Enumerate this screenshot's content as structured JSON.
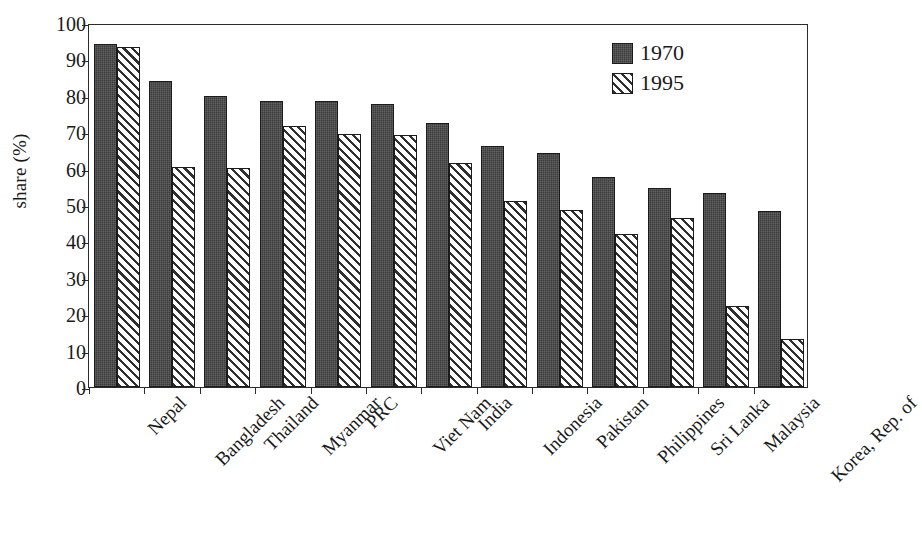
{
  "chart": {
    "type": "bar",
    "ylabel": "share (%)",
    "xlabel": "",
    "title": "",
    "legend_position": "top-right"
  },
  "axis": {
    "y_ticks": [
      "100",
      "90",
      "80",
      "70",
      "60",
      "50",
      "40",
      "30",
      "20",
      "10",
      "0"
    ],
    "y_min": 0,
    "y_max": 100,
    "y_step": 10
  },
  "legend": {
    "entries": [
      {
        "label": "1970",
        "swatch": "solid-dark",
        "color": "#3b3b3b"
      },
      {
        "label": "1995",
        "swatch": "diagonal-hatch",
        "color": "#2f2f2f"
      }
    ]
  },
  "chart_data": {
    "type": "bar",
    "title": "",
    "xlabel": "",
    "ylabel": "share (%)",
    "ylim": [
      0,
      100
    ],
    "ytick_step": 10,
    "grid": false,
    "legend_position": "top-right",
    "categories": [
      "Nepal",
      "Bangladesh",
      "Thailand",
      "Myanmar",
      "PRC",
      "Viet Nam",
      "India",
      "Indonesia",
      "Pakistan",
      "Philippines",
      "Sri Lanka",
      "Malaysia",
      "Korea, Rep. of"
    ],
    "series": [
      {
        "name": "1970",
        "values": [
          94.3,
          84.0,
          80.0,
          78.7,
          78.7,
          77.8,
          72.5,
          66.2,
          64.3,
          57.6,
          54.7,
          53.4,
          48.4
        ]
      },
      {
        "name": "1995",
        "values": [
          93.3,
          60.5,
          60.1,
          71.7,
          69.4,
          69.2,
          61.5,
          51.2,
          48.7,
          41.9,
          46.5,
          22.3,
          13.2
        ]
      }
    ]
  }
}
